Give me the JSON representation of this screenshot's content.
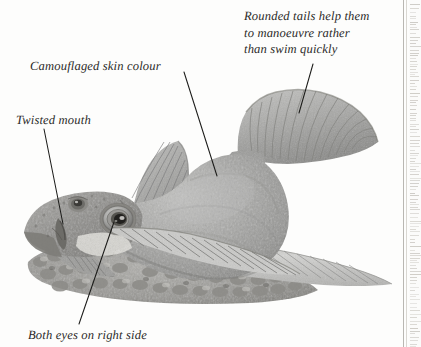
{
  "page": {
    "width": 421,
    "height": 347,
    "background_color": "#fdfdfc",
    "type": "book-page-illustration"
  },
  "illustration": {
    "subject": "flatfish-diagram",
    "description": "Pencil and wash illustration of a flatfish (flounder/sole) resting on a gravel seabed, shown in side-top view with both eyes on the right side",
    "colors": {
      "body_grey": "#a8a8a8",
      "body_shadow": "#7d7d7d",
      "body_highlight": "#c9c9c7",
      "fin_light": "#d2d2d0",
      "fin_ray": "#8e8e8c",
      "gravel_grey": "#9b9a96",
      "gravel_dark": "#6f6e6a",
      "eye_dark": "#2a2a28",
      "leader_line": "#1c1c1a",
      "background": "#ffffff"
    }
  },
  "annotations": [
    {
      "id": "tail",
      "name": "rounded-tails-label",
      "text": "Rounded tails help them\nto manoeuvre rather\nthan swim quickly",
      "lines": [
        "Rounded tails help them",
        "to manoeuvre rather",
        "than swim quickly"
      ],
      "leader": {
        "x1": 313,
        "y1": 64,
        "x2": 299,
        "y2": 113
      }
    },
    {
      "id": "skin",
      "name": "camouflaged-skin-colour-label",
      "text": "Camouflaged skin colour",
      "lines": [
        "Camouflaged skin colour"
      ],
      "leader": {
        "x1": 184,
        "y1": 72,
        "x2": 217,
        "y2": 176
      }
    },
    {
      "id": "mouth",
      "name": "twisted-mouth-label",
      "text": "Twisted mouth",
      "lines": [
        "Twisted mouth"
      ],
      "leader": {
        "x1": 44,
        "y1": 129,
        "x2": 63,
        "y2": 224
      }
    },
    {
      "id": "eyes",
      "name": "both-eyes-on-right-side-label",
      "text": "Both eyes on right side",
      "lines": [
        "Both eyes on right side"
      ],
      "leader": {
        "x1": 114,
        "y1": 222,
        "x2": 79,
        "y2": 324
      }
    }
  ],
  "gutter": {
    "name": "page-gutter",
    "rule_color": "#b9b7b2",
    "strip_color": "#fbfbfa",
    "description": "Vertical page rule and faint edge of adjacent text column at right margin"
  }
}
